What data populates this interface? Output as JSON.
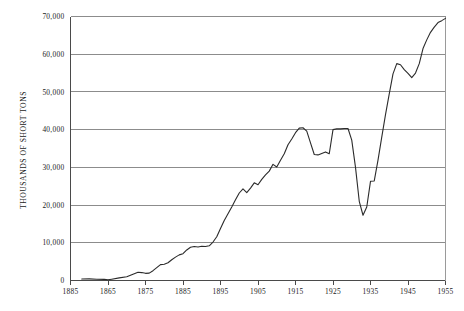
{
  "chart_data": {
    "type": "line",
    "title": "",
    "xlabel": "",
    "ylabel": "THOUSANDS OF SHORT TONS",
    "xlim": [
      1855,
      1955
    ],
    "ylim": [
      0,
      70000
    ],
    "grid": true,
    "legend": false,
    "legend_position": "none",
    "x_tick_labels": [
      "1885",
      "1865",
      "1875",
      "1885",
      "1895",
      "1905",
      "1915",
      "1925",
      "1935",
      "1945",
      "1955"
    ],
    "x_ticks": [
      1855,
      1865,
      1875,
      1885,
      1895,
      1905,
      1915,
      1925,
      1935,
      1945,
      1955
    ],
    "y_tick_labels": [
      "0",
      "10,000",
      "20,000",
      "30,000",
      "40,000",
      "50,000",
      "60,000",
      "70,000"
    ],
    "y_ticks": [
      0,
      10000,
      20000,
      30000,
      40000,
      50000,
      60000,
      70000
    ],
    "series": [
      {
        "name": "production",
        "color": "#2b2b2b",
        "x": [
          1858,
          1860,
          1862,
          1864,
          1865,
          1866,
          1868,
          1870,
          1872,
          1873,
          1874,
          1875,
          1876,
          1877,
          1878,
          1879,
          1880,
          1881,
          1882,
          1883,
          1884,
          1885,
          1886,
          1887,
          1888,
          1889,
          1890,
          1891,
          1892,
          1893,
          1894,
          1895,
          1896,
          1897,
          1898,
          1899,
          1900,
          1901,
          1902,
          1903,
          1904,
          1905,
          1906,
          1907,
          1908,
          1909,
          1910,
          1911,
          1912,
          1913,
          1914,
          1915,
          1916,
          1917,
          1918,
          1919,
          1920,
          1921,
          1922,
          1923,
          1924,
          1925,
          1926,
          1927,
          1928,
          1929,
          1930,
          1931,
          1932,
          1933,
          1934,
          1935,
          1936,
          1937,
          1938,
          1939,
          1940,
          1941,
          1942,
          1943,
          1944,
          1945,
          1946,
          1947,
          1948,
          1949,
          1950,
          1951,
          1952,
          1953,
          1954,
          1955
        ],
        "values": [
          400,
          420,
          330,
          300,
          180,
          350,
          700,
          1000,
          1800,
          2200,
          2100,
          1900,
          1950,
          2600,
          3400,
          4200,
          4300,
          4700,
          5500,
          6200,
          6800,
          7100,
          8100,
          8800,
          9000,
          8900,
          9100,
          9000,
          9200,
          10200,
          11600,
          13800,
          15900,
          17700,
          19500,
          21400,
          23200,
          24300,
          23300,
          24500,
          25900,
          25400,
          26800,
          28000,
          29000,
          30800,
          30100,
          31900,
          33600,
          36000,
          37500,
          39200,
          40400,
          40500,
          39600,
          36500,
          33400,
          33300,
          33700,
          34100,
          33600,
          40000,
          40200,
          40200,
          40300,
          40300,
          37200,
          30000,
          21000,
          17300,
          19500,
          26300,
          26400,
          31900,
          38000,
          44000,
          49500,
          54800,
          57500,
          57200,
          55900,
          54900,
          53800,
          55000,
          57500,
          61500,
          63800,
          65800,
          67200,
          68400,
          68900,
          69500
        ]
      }
    ],
    "annotations": []
  }
}
